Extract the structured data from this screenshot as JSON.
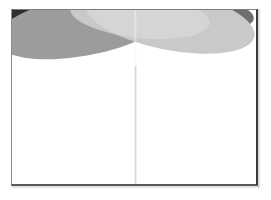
{
  "document": {
    "type": "scanned-page-spread",
    "page_label": "",
    "body_text": "",
    "background_color": "#ffffff"
  },
  "frame": {
    "name": "page-sheet",
    "left": 11,
    "top": 9,
    "width": 247,
    "height": 177,
    "border_top_color": "#7b7b7b",
    "border_left_color": "#8c8c8c",
    "border_right_color": "#3c3c3c",
    "border_bottom_color": "#5a5a5a"
  },
  "gutter": {
    "name": "book-gutter-fold",
    "x": 122,
    "color": "#cecece",
    "label": ""
  },
  "header_art": {
    "title": "",
    "height": 56,
    "description": "overlapping rotated ellipses",
    "colors": {
      "charcoal": "#2f2f2f",
      "dark_gray": "#6e6e6e",
      "mid_gray": "#9c9c9c",
      "light_gray": "#c9c9c9",
      "pale_gray": "#d8d8d8"
    },
    "shapes": [
      {
        "name": "ellipse-charcoal-back",
        "fill": "#2f2f2f",
        "cx": 66,
        "cy": -4,
        "rx": 96,
        "ry": 30,
        "rotate": 9,
        "opacity": 1
      },
      {
        "name": "ellipse-dark-band",
        "fill": "#6e6e6e",
        "cx": 150,
        "cy": 2,
        "rx": 92,
        "ry": 22,
        "rotate": 4,
        "opacity": 1
      },
      {
        "name": "ellipse-mid-left",
        "fill": "#9c9c9c",
        "cx": 70,
        "cy": 16,
        "rx": 88,
        "ry": 30,
        "rotate": -10,
        "opacity": 1
      },
      {
        "name": "ellipse-light-right",
        "fill": "#c9c9c9",
        "cx": 158,
        "cy": 10,
        "rx": 86,
        "ry": 30,
        "rotate": 11,
        "opacity": 1
      },
      {
        "name": "ellipse-pale-overlay",
        "fill": "#d8d8d8",
        "cx": 128,
        "cy": 6,
        "rx": 70,
        "ry": 22,
        "rotate": 6,
        "opacity": 0.75
      }
    ]
  }
}
